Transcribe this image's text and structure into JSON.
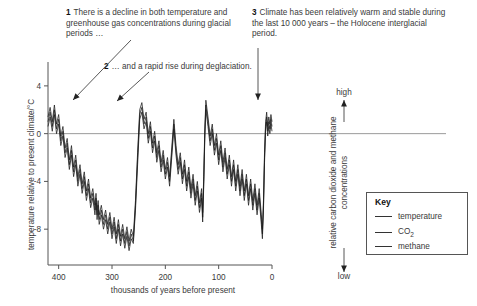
{
  "annotations": [
    {
      "num": "1",
      "text": "There is a decline in both temperature and greenhouse gas concentrations during glacial periods …"
    },
    {
      "num": "2",
      "text": "… and a rapid rise during deglaciation."
    },
    {
      "num": "3",
      "text": "Climate has been relatively warm and stable during the last 10 000 years – the Holocene interglacial period."
    }
  ],
  "right_axis": {
    "high": "high",
    "low": "low",
    "label": "relative carbon dioxide and methane concentrations"
  },
  "legend": {
    "title": "Key",
    "items": [
      {
        "label": "temperature"
      },
      {
        "label": "CO2"
      },
      {
        "label": "methane"
      }
    ]
  },
  "chart_data": {
    "type": "line",
    "title": "",
    "xlabel": "thousands of years before present",
    "ylabel": "temperature relative to present climate/°C",
    "xlim": [
      420,
      0
    ],
    "ylim": [
      -11,
      6
    ],
    "xticks": [
      400,
      300,
      200,
      100,
      0
    ],
    "yticks": [
      4,
      0,
      -4,
      -8
    ],
    "grid": false,
    "zero_reference_line": 0,
    "legend_position": "right",
    "x_descending": true,
    "series": [
      {
        "name": "temperature",
        "x": [
          420,
          416,
          412,
          408,
          404,
          400,
          396,
          392,
          388,
          384,
          380,
          376,
          372,
          368,
          364,
          360,
          356,
          352,
          348,
          344,
          340,
          336,
          332,
          330,
          328,
          326,
          324,
          320,
          316,
          312,
          308,
          304,
          300,
          296,
          292,
          288,
          284,
          280,
          276,
          272,
          268,
          264,
          260,
          256,
          252,
          248,
          244,
          240,
          236,
          232,
          228,
          224,
          220,
          216,
          212,
          208,
          204,
          200,
          196,
          192,
          188,
          184,
          180,
          176,
          172,
          168,
          164,
          160,
          156,
          152,
          148,
          144,
          140,
          136,
          132,
          130,
          128,
          126,
          124,
          120,
          116,
          112,
          108,
          104,
          100,
          96,
          92,
          88,
          84,
          80,
          76,
          72,
          68,
          64,
          60,
          56,
          52,
          48,
          44,
          40,
          36,
          32,
          28,
          24,
          20,
          18,
          16,
          14,
          12,
          10,
          8,
          6,
          4,
          2,
          0
        ],
        "values": [
          1.0,
          1.8,
          0.6,
          2.0,
          0.4,
          1.2,
          -0.6,
          0.2,
          -1.6,
          -0.8,
          -2.6,
          -1.4,
          -3.2,
          -2.2,
          -4.0,
          -3.0,
          -4.6,
          -3.6,
          -5.2,
          -4.2,
          -5.8,
          -5.0,
          -6.4,
          -5.4,
          -6.8,
          -6.0,
          -7.2,
          -6.4,
          -7.6,
          -6.8,
          -8.0,
          -7.0,
          -8.4,
          -7.4,
          -8.8,
          -7.6,
          -9.0,
          -8.0,
          -9.2,
          -8.2,
          -9.4,
          -8.4,
          -9.0,
          -6.0,
          -2.0,
          1.6,
          2.2,
          0.8,
          1.4,
          -0.4,
          0.6,
          -1.2,
          -0.2,
          -2.0,
          -1.0,
          -2.8,
          -1.8,
          -3.4,
          -2.4,
          -4.0,
          -1.6,
          0.8,
          -1.4,
          -3.0,
          -2.0,
          -3.8,
          -2.6,
          -4.4,
          -3.2,
          -5.0,
          -3.8,
          -5.6,
          -4.4,
          -6.2,
          -5.0,
          -7.0,
          -4.0,
          0.0,
          2.4,
          1.0,
          -0.6,
          0.4,
          -1.4,
          -0.4,
          -2.2,
          -1.0,
          -2.8,
          -1.6,
          -3.4,
          -2.2,
          -4.0,
          -2.6,
          -4.4,
          -3.0,
          -4.8,
          -3.4,
          -5.2,
          -3.8,
          -5.6,
          -4.2,
          -6.0,
          -4.6,
          -6.4,
          -5.0,
          -7.2,
          -8.4,
          -6.0,
          -2.0,
          0.6,
          1.4,
          0.2,
          1.0,
          0.4,
          1.2,
          0.6
        ]
      },
      {
        "name": "CO2",
        "x": [
          420,
          416,
          412,
          408,
          404,
          400,
          396,
          392,
          388,
          384,
          380,
          376,
          372,
          368,
          364,
          360,
          356,
          352,
          348,
          344,
          340,
          336,
          332,
          330,
          328,
          326,
          324,
          320,
          316,
          312,
          308,
          304,
          300,
          296,
          292,
          288,
          284,
          280,
          276,
          272,
          268,
          264,
          260,
          256,
          252,
          248,
          244,
          240,
          236,
          232,
          228,
          224,
          220,
          216,
          212,
          208,
          204,
          200,
          196,
          192,
          188,
          184,
          180,
          176,
          172,
          168,
          164,
          160,
          156,
          152,
          148,
          144,
          140,
          136,
          132,
          130,
          128,
          126,
          124,
          120,
          116,
          112,
          108,
          104,
          100,
          96,
          92,
          88,
          84,
          80,
          76,
          72,
          68,
          64,
          60,
          56,
          52,
          48,
          44,
          40,
          36,
          32,
          28,
          24,
          20,
          18,
          16,
          14,
          12,
          10,
          8,
          6,
          4,
          2,
          0
        ],
        "values": [
          0.6,
          1.4,
          0.2,
          1.6,
          0.0,
          0.8,
          -1.0,
          -0.2,
          -2.0,
          -1.2,
          -3.0,
          -1.8,
          -3.6,
          -2.6,
          -4.4,
          -3.4,
          -5.0,
          -4.0,
          -5.6,
          -4.6,
          -6.2,
          -5.4,
          -6.8,
          -5.8,
          -7.2,
          -6.4,
          -7.6,
          -6.8,
          -8.0,
          -7.2,
          -8.4,
          -7.4,
          -8.8,
          -7.8,
          -9.2,
          -8.0,
          -9.4,
          -8.4,
          -9.6,
          -8.6,
          -9.8,
          -8.8,
          -9.2,
          -6.4,
          -2.6,
          1.2,
          1.8,
          0.4,
          1.0,
          -0.8,
          0.2,
          -1.6,
          -0.6,
          -2.4,
          -1.4,
          -3.2,
          -2.2,
          -3.8,
          -2.8,
          -4.4,
          -2.0,
          0.4,
          -1.8,
          -3.4,
          -2.4,
          -4.2,
          -3.0,
          -4.8,
          -3.6,
          -5.4,
          -4.2,
          -6.0,
          -4.8,
          -6.6,
          -5.4,
          -7.4,
          -4.4,
          -0.4,
          2.0,
          0.6,
          -1.0,
          0.0,
          -1.8,
          -0.8,
          -2.6,
          -1.4,
          -3.2,
          -2.0,
          -3.8,
          -2.6,
          -4.4,
          -3.0,
          -4.8,
          -3.4,
          -5.2,
          -3.8,
          -5.6,
          -4.2,
          -6.0,
          -4.6,
          -6.4,
          -5.0,
          -6.8,
          -5.4,
          -7.6,
          -8.8,
          -6.4,
          -2.4,
          0.2,
          1.0,
          -0.2,
          0.6,
          0.0,
          0.8,
          0.2
        ]
      },
      {
        "name": "methane",
        "x": [
          420,
          416,
          412,
          408,
          404,
          400,
          396,
          392,
          388,
          384,
          380,
          376,
          372,
          368,
          364,
          360,
          356,
          352,
          348,
          344,
          340,
          336,
          332,
          330,
          328,
          326,
          324,
          320,
          316,
          312,
          308,
          304,
          300,
          296,
          292,
          288,
          284,
          280,
          276,
          272,
          268,
          264,
          260,
          256,
          252,
          248,
          244,
          240,
          236,
          232,
          228,
          224,
          220,
          216,
          212,
          208,
          204,
          200,
          196,
          192,
          188,
          184,
          180,
          176,
          172,
          168,
          164,
          160,
          156,
          152,
          148,
          144,
          140,
          136,
          132,
          130,
          128,
          126,
          124,
          120,
          116,
          112,
          108,
          104,
          100,
          96,
          92,
          88,
          84,
          80,
          76,
          72,
          68,
          64,
          60,
          56,
          52,
          48,
          44,
          40,
          36,
          32,
          28,
          24,
          20,
          18,
          16,
          14,
          12,
          10,
          8,
          6,
          4,
          2,
          0
        ],
        "values": [
          1.4,
          2.2,
          1.0,
          2.4,
          0.8,
          1.6,
          -0.2,
          0.6,
          -1.2,
          -0.4,
          -2.2,
          -1.0,
          -2.8,
          -1.8,
          -3.6,
          -2.6,
          -4.2,
          -3.2,
          -4.8,
          -3.8,
          -5.4,
          -4.6,
          -6.0,
          -5.0,
          -6.4,
          -5.6,
          -6.8,
          -6.0,
          -7.2,
          -6.4,
          -7.6,
          -6.6,
          -8.0,
          -7.0,
          -8.4,
          -7.2,
          -8.6,
          -7.6,
          -8.8,
          -7.8,
          -9.0,
          -8.0,
          -8.6,
          -5.6,
          -1.6,
          2.0,
          2.6,
          1.2,
          1.8,
          0.0,
          1.0,
          -0.8,
          0.2,
          -1.6,
          -0.6,
          -2.4,
          -1.4,
          -3.0,
          -2.0,
          -3.6,
          -1.2,
          1.2,
          -1.0,
          -2.6,
          -1.6,
          -3.4,
          -2.2,
          -4.0,
          -2.8,
          -4.6,
          -3.4,
          -5.2,
          -4.0,
          -5.8,
          -4.6,
          -6.6,
          -3.6,
          0.4,
          2.8,
          1.4,
          -0.2,
          0.8,
          -1.0,
          0.0,
          -1.8,
          -0.6,
          -2.4,
          -1.2,
          -3.0,
          -1.8,
          -3.6,
          -2.2,
          -4.0,
          -2.6,
          -4.4,
          -3.0,
          -4.8,
          -3.4,
          -5.2,
          -3.8,
          -5.6,
          -4.2,
          -6.0,
          -4.6,
          -6.8,
          -8.0,
          -5.6,
          -1.6,
          1.0,
          1.8,
          0.6,
          1.4,
          0.8,
          1.6,
          1.0
        ]
      }
    ]
  }
}
